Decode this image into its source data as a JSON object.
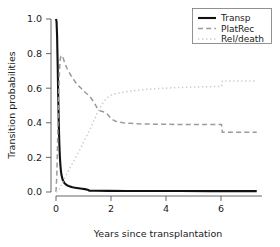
{
  "chart_data": {
    "type": "line",
    "title": "",
    "xlabel": "Years since transplantation",
    "ylabel": "Transition probabilities",
    "xlim": [
      -0.18,
      7.55
    ],
    "ylim": [
      -0.02,
      1.03
    ],
    "xticks": [
      "0",
      "2",
      "4",
      "6"
    ],
    "xtick_values": [
      0,
      2,
      4,
      6
    ],
    "yticks": [
      "0.0",
      "0.2",
      "0.4",
      "0.6",
      "0.8",
      "1.0"
    ],
    "ytick_values": [
      0.0,
      0.2,
      0.4,
      0.6,
      0.8,
      1.0
    ],
    "grid": false,
    "legend_position": "top-right",
    "series": [
      {
        "name": "Transp",
        "style": "solid",
        "color": "#111111",
        "width": 2.1,
        "x": [
          0.0,
          0.02,
          0.04,
          0.06,
          0.08,
          0.1,
          0.12,
          0.14,
          0.16,
          0.18,
          0.2,
          0.24,
          0.28,
          0.32,
          0.38,
          0.44,
          0.52,
          0.6,
          0.7,
          0.82,
          0.95,
          1.05,
          1.15,
          1.22,
          1.45,
          1.9,
          2.6,
          3.4,
          4.5,
          5.6,
          6.5,
          7.3
        ],
        "y": [
          1.0,
          0.985,
          0.9,
          0.74,
          0.56,
          0.4,
          0.285,
          0.205,
          0.155,
          0.12,
          0.098,
          0.072,
          0.058,
          0.049,
          0.041,
          0.036,
          0.031,
          0.028,
          0.025,
          0.022,
          0.019,
          0.0165,
          0.013,
          0.0075,
          0.007,
          0.0065,
          0.006,
          0.0058,
          0.0055,
          0.0052,
          0.005,
          0.005
        ]
      },
      {
        "name": "PlatRec",
        "style": "dashed",
        "color": "#9a9a9a",
        "width": 1.5,
        "x": [
          0.0,
          0.03,
          0.06,
          0.09,
          0.12,
          0.15,
          0.18,
          0.22,
          0.26,
          0.32,
          0.4,
          0.5,
          0.62,
          0.75,
          0.88,
          1.0,
          1.12,
          1.22,
          1.32,
          1.42,
          1.52,
          1.62,
          1.75,
          1.88,
          2.0,
          2.12,
          2.25,
          2.45,
          2.7,
          3.0,
          3.5,
          4.1,
          4.7,
          5.3,
          5.8,
          6.02,
          6.05,
          6.6,
          7.3
        ],
        "y": [
          0.0,
          0.1,
          0.3,
          0.52,
          0.68,
          0.765,
          0.785,
          0.79,
          0.775,
          0.745,
          0.715,
          0.685,
          0.655,
          0.625,
          0.605,
          0.585,
          0.568,
          0.555,
          0.532,
          0.508,
          0.478,
          0.468,
          0.462,
          0.448,
          0.425,
          0.412,
          0.405,
          0.4,
          0.397,
          0.394,
          0.392,
          0.391,
          0.39,
          0.39,
          0.39,
          0.39,
          0.345,
          0.345,
          0.345
        ]
      },
      {
        "name": "Rel/death",
        "style": "dotted",
        "color": "#cccccc",
        "width": 1.5,
        "x": [
          0.0,
          0.05,
          0.1,
          0.16,
          0.22,
          0.3,
          0.4,
          0.5,
          0.62,
          0.75,
          0.88,
          1.0,
          1.12,
          1.22,
          1.32,
          1.42,
          1.52,
          1.62,
          1.72,
          1.82,
          1.92,
          2.02,
          2.15,
          2.3,
          2.5,
          2.8,
          3.2,
          3.7,
          4.2,
          4.8,
          5.4,
          5.9,
          6.02,
          6.05,
          6.6,
          7.3
        ],
        "y": [
          0.0,
          0.005,
          0.012,
          0.028,
          0.048,
          0.075,
          0.108,
          0.138,
          0.172,
          0.21,
          0.248,
          0.288,
          0.325,
          0.355,
          0.392,
          0.425,
          0.465,
          0.492,
          0.518,
          0.538,
          0.552,
          0.562,
          0.568,
          0.572,
          0.578,
          0.585,
          0.592,
          0.598,
          0.602,
          0.606,
          0.608,
          0.61,
          0.61,
          0.642,
          0.642,
          0.642
        ]
      }
    ]
  },
  "legend": {
    "entries": [
      {
        "label": "Transp"
      },
      {
        "label": "PlatRec"
      },
      {
        "label": "Rel/death"
      }
    ]
  }
}
